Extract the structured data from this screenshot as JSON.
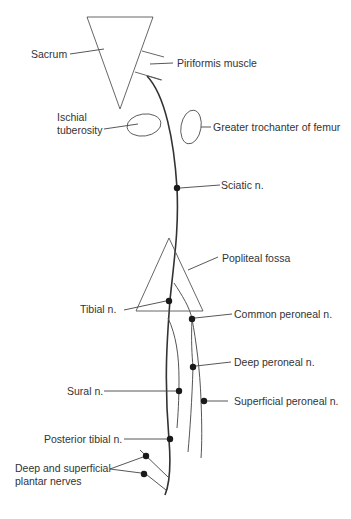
{
  "diagram": {
    "labels": {
      "sacrum": "Sacrum",
      "piriformis": "Piriformis muscle",
      "ischial_line1": "Ischial",
      "ischial_line2": "tuberosity",
      "greater_trochanter": "Greater trochanter of femur",
      "sciatic": "Sciatic n.",
      "popliteal": "Popliteal fossa",
      "tibial": "Tibial n.",
      "common_peroneal": "Common peroneal n.",
      "deep_peroneal": "Deep peroneal n.",
      "sural": "Sural n.",
      "superficial_peroneal": "Superficial peroneal n.",
      "posterior_tibial": "Posterior tibial n.",
      "plantar_line1": "Deep and superficial",
      "plantar_line2": "plantar nerves"
    },
    "colors": {
      "line": "#555555",
      "nerve": "#333333",
      "dot": "#1a1a1a",
      "text": "#333333"
    }
  }
}
